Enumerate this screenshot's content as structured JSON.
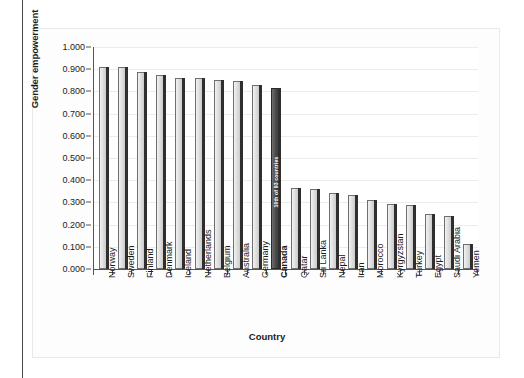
{
  "chart_data": {
    "type": "bar",
    "title": "",
    "xlabel": "Country",
    "ylabel": "Gender empowerment",
    "ylim": [
      0.0,
      1.0
    ],
    "ytick_labels": [
      "1.000",
      "0.900",
      "0.800",
      "0.700",
      "0.600",
      "0.500",
      "0.400",
      "0.300",
      "0.200",
      "0.100",
      "0.000"
    ],
    "ytick_values": [
      1.0,
      0.9,
      0.8,
      0.7,
      0.6,
      0.5,
      0.4,
      0.3,
      0.2,
      0.1,
      0.0
    ],
    "grid": true,
    "legend": "none",
    "categories": [
      "Norway",
      "Sweden",
      "Finland",
      "Denmark",
      "Iceland",
      "Netherlands",
      "Belgium",
      "Australia",
      "Germany",
      "Canada",
      "Qatar",
      "Sri Lanka",
      "Nepal",
      "Iran",
      "Morocco",
      "Kyrgyzstan",
      "Turkey",
      "Egypt",
      "Saudi Arabia",
      "Yemen"
    ],
    "values": [
      0.91,
      0.908,
      0.887,
      0.875,
      0.862,
      0.859,
      0.85,
      0.847,
      0.831,
      0.815,
      0.367,
      0.359,
      0.344,
      0.334,
      0.313,
      0.291,
      0.289,
      0.248,
      0.239,
      0.111
    ],
    "highlight_category": "Canada",
    "highlight_index": 9,
    "annotations": [
      {
        "category": "Canada",
        "text": "10th of 93 countries"
      }
    ],
    "colors": {
      "bar_fill": "#d2d2d2",
      "bar_edge": "#6f6f6f",
      "highlight_fill": "#3f3f3f",
      "axis": "#555555",
      "gridline": "#ececec",
      "text": "#1b1b1b",
      "page_background": "#ffffff",
      "card_background": "#fdfdfd",
      "annotation_text": "#ffffff"
    }
  }
}
